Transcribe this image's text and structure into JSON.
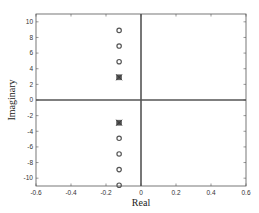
{
  "chart_data": {
    "type": "scatter",
    "title": "",
    "xlabel": "Real",
    "ylabel": "Imaginary",
    "xlim": [
      -0.6,
      0.6
    ],
    "ylim": [
      -11,
      11
    ],
    "xticks": [
      -0.6,
      -0.4,
      -0.2,
      0,
      0.2,
      0.4,
      0.6
    ],
    "xtick_labels": [
      "-0.6",
      "-0.4",
      "-0.2",
      "0",
      "0.2",
      "0.4",
      "0.6"
    ],
    "yticks": [
      -10,
      -8,
      -6,
      -4,
      -2,
      0,
      2,
      4,
      6,
      8,
      10
    ],
    "ytick_labels": [
      "-10",
      "-8",
      "-6",
      "-4",
      "-2",
      "0",
      "2",
      "4",
      "6",
      "8",
      "10"
    ],
    "grid": false,
    "legend": null,
    "series": [
      {
        "name": "zeros",
        "marker": "circle",
        "points": [
          [
            -0.125,
            8.9
          ],
          [
            -0.125,
            6.9
          ],
          [
            -0.125,
            4.9
          ],
          [
            -0.125,
            -4.9
          ],
          [
            -0.125,
            -6.9
          ],
          [
            -0.125,
            -8.9
          ],
          [
            -0.125,
            -10.9
          ]
        ]
      },
      {
        "name": "poles",
        "marker": "x-square",
        "points": [
          [
            -0.125,
            2.9
          ],
          [
            -0.125,
            -2.9
          ]
        ]
      }
    ],
    "reference_lines": {
      "horizontal_at_y": 0,
      "vertical_at_x": 0
    }
  },
  "colors": {
    "axis": "#555555",
    "reference_line": "#555555",
    "marker": "#555555",
    "background": "#ffffff"
  }
}
